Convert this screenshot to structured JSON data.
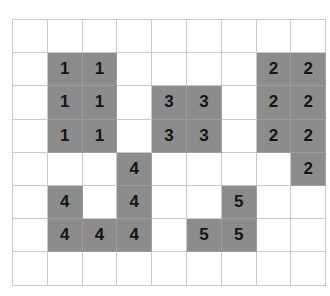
{
  "figure": {
    "title": "",
    "caption": "",
    "background_color": "#ffffff",
    "grid_line_color": "#c9c9c9",
    "filled_cell_color": "#8c8c8c",
    "label_color": "#141414",
    "rows": 8,
    "columns": 9
  },
  "grid": {
    "cells": [
      [
        {
          "value": "",
          "filled": false
        },
        {
          "value": "",
          "filled": false
        },
        {
          "value": "",
          "filled": false
        },
        {
          "value": "",
          "filled": false
        },
        {
          "value": "",
          "filled": false
        },
        {
          "value": "",
          "filled": false
        },
        {
          "value": "",
          "filled": false
        },
        {
          "value": "",
          "filled": false
        },
        {
          "value": "",
          "filled": false
        }
      ],
      [
        {
          "value": "",
          "filled": false
        },
        {
          "value": "1",
          "filled": true
        },
        {
          "value": "1",
          "filled": true
        },
        {
          "value": "",
          "filled": false
        },
        {
          "value": "",
          "filled": false
        },
        {
          "value": "",
          "filled": false
        },
        {
          "value": "",
          "filled": false
        },
        {
          "value": "2",
          "filled": true
        },
        {
          "value": "2",
          "filled": true
        }
      ],
      [
        {
          "value": "",
          "filled": false
        },
        {
          "value": "1",
          "filled": true
        },
        {
          "value": "1",
          "filled": true
        },
        {
          "value": "",
          "filled": false
        },
        {
          "value": "3",
          "filled": true
        },
        {
          "value": "3",
          "filled": true
        },
        {
          "value": "",
          "filled": false
        },
        {
          "value": "2",
          "filled": true
        },
        {
          "value": "2",
          "filled": true
        }
      ],
      [
        {
          "value": "",
          "filled": false
        },
        {
          "value": "1",
          "filled": true
        },
        {
          "value": "1",
          "filled": true
        },
        {
          "value": "",
          "filled": false
        },
        {
          "value": "3",
          "filled": true
        },
        {
          "value": "3",
          "filled": true
        },
        {
          "value": "",
          "filled": false
        },
        {
          "value": "2",
          "filled": true
        },
        {
          "value": "2",
          "filled": true
        }
      ],
      [
        {
          "value": "",
          "filled": false
        },
        {
          "value": "",
          "filled": false
        },
        {
          "value": "",
          "filled": false
        },
        {
          "value": "4",
          "filled": true
        },
        {
          "value": "",
          "filled": false
        },
        {
          "value": "",
          "filled": false
        },
        {
          "value": "",
          "filled": false
        },
        {
          "value": "",
          "filled": false
        },
        {
          "value": "2",
          "filled": true
        }
      ],
      [
        {
          "value": "",
          "filled": false
        },
        {
          "value": "4",
          "filled": true
        },
        {
          "value": "",
          "filled": false
        },
        {
          "value": "4",
          "filled": true
        },
        {
          "value": "",
          "filled": false
        },
        {
          "value": "",
          "filled": false
        },
        {
          "value": "5",
          "filled": true
        },
        {
          "value": "",
          "filled": false
        },
        {
          "value": "",
          "filled": false
        }
      ],
      [
        {
          "value": "",
          "filled": false
        },
        {
          "value": "4",
          "filled": true
        },
        {
          "value": "4",
          "filled": true
        },
        {
          "value": "4",
          "filled": true
        },
        {
          "value": "",
          "filled": false
        },
        {
          "value": "5",
          "filled": true
        },
        {
          "value": "5",
          "filled": true
        },
        {
          "value": "",
          "filled": false
        },
        {
          "value": "",
          "filled": false
        }
      ],
      [
        {
          "value": "",
          "filled": false
        },
        {
          "value": "",
          "filled": false
        },
        {
          "value": "",
          "filled": false
        },
        {
          "value": "",
          "filled": false
        },
        {
          "value": "",
          "filled": false
        },
        {
          "value": "",
          "filled": false
        },
        {
          "value": "",
          "filled": false
        },
        {
          "value": "",
          "filled": false
        },
        {
          "value": "",
          "filled": false
        }
      ]
    ]
  },
  "regions": [
    {
      "label": "1",
      "cell_count": 6
    },
    {
      "label": "2",
      "cell_count": 7
    },
    {
      "label": "3",
      "cell_count": 4
    },
    {
      "label": "4",
      "cell_count": 5
    },
    {
      "label": "5",
      "cell_count": 3
    }
  ]
}
